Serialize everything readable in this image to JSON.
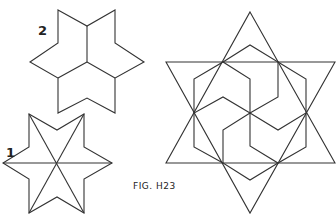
{
  "figure": {
    "caption": "FIG. H23",
    "labels": [
      {
        "id": "label-2",
        "text": "2"
      },
      {
        "id": "label-1",
        "text": "1"
      }
    ],
    "parts": [
      {
        "label": "2",
        "description": "six-pointed star divided into three rhombi"
      },
      {
        "label": "1",
        "description": "six-pointed star divided into six triangles by three diagonals"
      },
      {
        "label": "",
        "description": "large six-pointed star with interlocking hexagonal pinwheel pattern"
      }
    ],
    "line_color": "#333333",
    "background": "#ffffff"
  }
}
